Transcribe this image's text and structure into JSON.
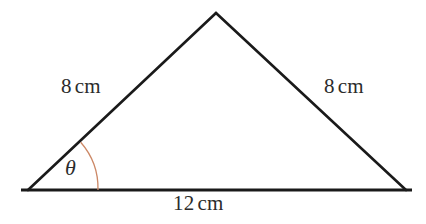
{
  "figure": {
    "type": "geometry-diagram",
    "shape": "isosceles-triangle",
    "background_color": "#ffffff",
    "stroke_color": "#1a1a1a",
    "stroke_width": 2.6,
    "arc_color": "#cc8866",
    "arc_width": 1.3,
    "text_color": "#2b2b2b",
    "vertices": {
      "left": {
        "x": 28,
        "y": 190
      },
      "apex": {
        "x": 216,
        "y": 13
      },
      "right": {
        "x": 406,
        "y": 190
      }
    },
    "base_extension": {
      "left_x": 21,
      "right_x": 412,
      "y": 190
    },
    "angle_arc": {
      "center_x": 28,
      "center_y": 190,
      "radius": 70,
      "start_x": 98,
      "start_y": 190,
      "end_x": 80.7,
      "end_y": 142.2
    },
    "labels": {
      "side_left": {
        "value": "8",
        "unit": "cm"
      },
      "side_right": {
        "value": "8",
        "unit": "cm"
      },
      "base": {
        "value": "12",
        "unit": "cm"
      },
      "angle": "θ"
    }
  }
}
